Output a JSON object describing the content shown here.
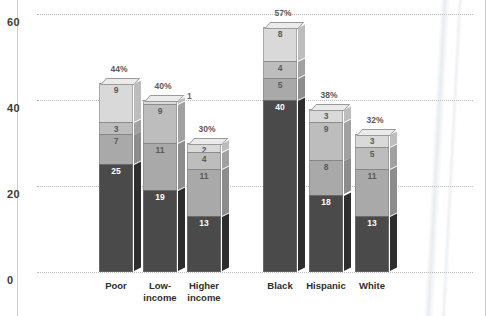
{
  "chart_data": {
    "type": "bar",
    "title": "",
    "subtitle": "",
    "xlabel": "",
    "ylabel": "",
    "stacked": true,
    "orientation": "vertical",
    "grid": true,
    "legend": "none",
    "ylim": [
      0,
      60
    ],
    "yticks": [
      0,
      20,
      40,
      60
    ],
    "ytick_labels": [
      "0",
      "20",
      "40",
      "60"
    ],
    "categories": [
      "Poor",
      "Low-income",
      "Higher income",
      "Black",
      "Hispanic",
      "White"
    ],
    "category_labels": [
      [
        "Poor"
      ],
      [
        "Low-",
        "income"
      ],
      [
        "Higher",
        "income"
      ],
      [
        "Black"
      ],
      [
        "Hispanic"
      ],
      [
        "White"
      ]
    ],
    "groups": [
      {
        "name": "income",
        "categories": [
          "Poor",
          "Low-income",
          "Higher income"
        ]
      },
      {
        "name": "race",
        "categories": [
          "Black",
          "Hispanic",
          "White"
        ]
      }
    ],
    "series": [
      {
        "name": "segment-1-bottom",
        "color": "#4a4a4a",
        "values": [
          25,
          19,
          13,
          40,
          18,
          13
        ]
      },
      {
        "name": "segment-2",
        "color": "#a9a9a9",
        "values": [
          7,
          11,
          11,
          5,
          8,
          11
        ]
      },
      {
        "name": "segment-3",
        "color": "#bdbdbd",
        "values": [
          3,
          9,
          4,
          4,
          9,
          5
        ]
      },
      {
        "name": "segment-4-top",
        "color": "#d9d9d9",
        "values": [
          9,
          1,
          2,
          8,
          3,
          3
        ]
      }
    ],
    "totals": [
      44,
      40,
      30,
      57,
      38,
      32
    ],
    "total_labels": [
      "44%",
      "40%",
      "30%",
      "57%",
      "38%",
      "32%"
    ],
    "bars": [
      {
        "category": "Poor",
        "total_label": "44%",
        "total": 44,
        "segments": [
          {
            "label": "9",
            "value": 9,
            "shade": "light"
          },
          {
            "label": "3",
            "value": 3,
            "shade": "mid-light"
          },
          {
            "label": "7",
            "value": 7,
            "shade": "mid"
          },
          {
            "label": "25",
            "value": 25,
            "shade": "dark"
          }
        ]
      },
      {
        "category": "Low-income",
        "total_label": "40%",
        "total": 40,
        "segments": [
          {
            "label": "1",
            "value": 1,
            "shade": "light",
            "label_outside": true
          },
          {
            "label": "9",
            "value": 9,
            "shade": "mid-light"
          },
          {
            "label": "11",
            "value": 11,
            "shade": "mid"
          },
          {
            "label": "19",
            "value": 19,
            "shade": "dark"
          }
        ]
      },
      {
        "category": "Higher income",
        "total_label": "30%",
        "total": 30,
        "segments": [
          {
            "label": "2",
            "value": 2,
            "shade": "light"
          },
          {
            "label": "4",
            "value": 4,
            "shade": "mid-light"
          },
          {
            "label": "11",
            "value": 11,
            "shade": "mid"
          },
          {
            "label": "13",
            "value": 13,
            "shade": "dark"
          }
        ]
      },
      {
        "category": "Black",
        "total_label": "57%",
        "total": 57,
        "segments": [
          {
            "label": "8",
            "value": 8,
            "shade": "light"
          },
          {
            "label": "4",
            "value": 4,
            "shade": "mid-light"
          },
          {
            "label": "5",
            "value": 5,
            "shade": "mid"
          },
          {
            "label": "40",
            "value": 40,
            "shade": "dark"
          }
        ]
      },
      {
        "category": "Hispanic",
        "total_label": "38%",
        "total": 38,
        "segments": [
          {
            "label": "3",
            "value": 3,
            "shade": "light"
          },
          {
            "label": "9",
            "value": 9,
            "shade": "mid-light"
          },
          {
            "label": "8",
            "value": 8,
            "shade": "mid"
          },
          {
            "label": "18",
            "value": 18,
            "shade": "dark"
          }
        ]
      },
      {
        "category": "White",
        "total_label": "32%",
        "total": 32,
        "segments": [
          {
            "label": "3",
            "value": 3,
            "shade": "light"
          },
          {
            "label": "5",
            "value": 5,
            "shade": "mid-light"
          },
          {
            "label": "11",
            "value": 11,
            "shade": "mid"
          },
          {
            "label": "13",
            "value": 13,
            "shade": "dark"
          }
        ]
      }
    ],
    "colors": {
      "light": "#d9d9d9",
      "mid_light": "#bdbdbd",
      "mid": "#a9a9a9",
      "dark": "#4a4a4a",
      "gridline": "#b9b9b9",
      "axis_text": "#3c3c3c",
      "background": "#ffffff"
    }
  }
}
